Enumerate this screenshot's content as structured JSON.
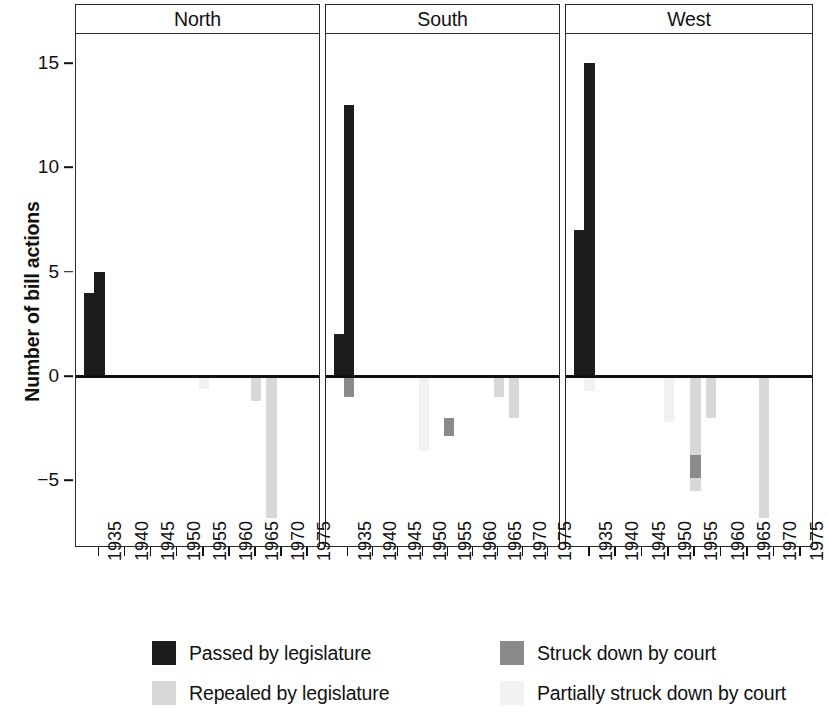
{
  "chart_data": {
    "type": "bar",
    "title": "",
    "subtitle": "",
    "xlabel": "",
    "ylabel": "Number of bill actions",
    "ylim": [
      -8.2,
      16.4
    ],
    "xlim": [
      1930.5,
      1977.5
    ],
    "ytick_values": [
      -5,
      0,
      5,
      10,
      15
    ],
    "ytick_labels": [
      "−5",
      "0",
      "5",
      "10",
      "15"
    ],
    "xtick_values": [
      1935,
      1940,
      1945,
      1950,
      1955,
      1960,
      1965,
      1970,
      1975
    ],
    "xtick_labels": [
      "1935",
      "1940",
      "1945",
      "1950",
      "1955",
      "1960",
      "1965",
      "1970",
      "1975"
    ],
    "grid": false,
    "legend_position": "bottom",
    "facet_labels": [
      "North",
      "South",
      "West"
    ],
    "series": [
      {
        "name": "Passed by legislature",
        "color": "#1c1c1c",
        "direction": "positive"
      },
      {
        "name": "Struck down by court",
        "color": "#8a8a8a",
        "direction": "negative"
      },
      {
        "name": "Repealed by legislature",
        "color": "#d8d8d8",
        "direction": "negative"
      },
      {
        "name": "Partially struck down by court",
        "color": "#f0f0f0",
        "direction": "negative"
      }
    ],
    "panels": [
      {
        "label": "North",
        "bars": [
          {
            "year": 1933,
            "series": "Passed by legislature",
            "base": 0,
            "value": 4
          },
          {
            "year": 1935,
            "series": "Passed by legislature",
            "base": 0,
            "value": 5
          },
          {
            "year": 1955,
            "series": "Partially struck down by court",
            "base": 0,
            "value": -0.6
          },
          {
            "year": 1965,
            "series": "Repealed by legislature",
            "base": 0,
            "value": -1.2
          },
          {
            "year": 1968,
            "series": "Repealed by legislature",
            "base": 0,
            "value": -6.8
          }
        ]
      },
      {
        "label": "South",
        "bars": [
          {
            "year": 1933,
            "series": "Passed by legislature",
            "base": 0,
            "value": 2
          },
          {
            "year": 1935,
            "series": "Passed by legislature",
            "base": 0,
            "value": 13
          },
          {
            "year": 1935,
            "series": "Struck down by court",
            "base": 0,
            "value": -1
          },
          {
            "year": 1950,
            "series": "Partially struck down by court",
            "base": 0,
            "value": -3.6
          },
          {
            "year": 1955,
            "series": "Struck down by court",
            "base": -2.0,
            "value": -0.9
          },
          {
            "year": 1965,
            "series": "Repealed by legislature",
            "base": 0,
            "value": -1
          },
          {
            "year": 1968,
            "series": "Repealed by legislature",
            "base": 0,
            "value": -2
          }
        ]
      },
      {
        "label": "West",
        "bars": [
          {
            "year": 1933,
            "series": "Passed by legislature",
            "base": 0,
            "value": 7
          },
          {
            "year": 1935,
            "series": "Passed by legislature",
            "base": 0,
            "value": 15
          },
          {
            "year": 1935,
            "series": "Partially struck down by court",
            "base": 0,
            "value": -0.7
          },
          {
            "year": 1950,
            "series": "Partially struck down by court",
            "base": 0,
            "value": -2.2
          },
          {
            "year": 1955,
            "series": "Repealed by legislature",
            "base": 0,
            "value": -5.5
          },
          {
            "year": 1955,
            "series": "Struck down by court",
            "base": -3.8,
            "value": -1.1
          },
          {
            "year": 1958,
            "series": "Repealed by legislature",
            "base": 0,
            "value": -2
          },
          {
            "year": 1968,
            "series": "Repealed by legislature",
            "base": 0,
            "value": -6.8
          }
        ]
      }
    ]
  },
  "legend": {
    "items": [
      {
        "label": "Passed by legislature",
        "color": "#1c1c1c"
      },
      {
        "label": "Struck down by court",
        "color": "#8a8a8a"
      },
      {
        "label": "Repealed by legislature",
        "color": "#d8d8d8"
      },
      {
        "label": "Partially struck down by court",
        "color": "#f1f1f1"
      }
    ]
  }
}
